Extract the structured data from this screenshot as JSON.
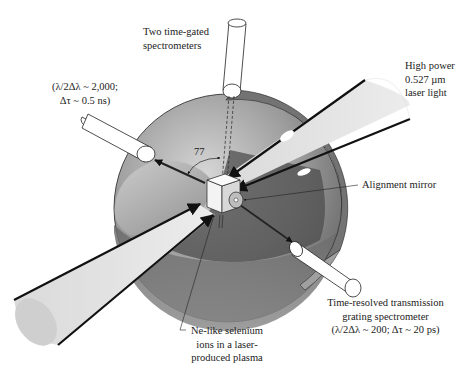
{
  "diagram": {
    "labels": {
      "spectrometers_top": [
        "Two time-gated",
        "spectrometers"
      ],
      "resolution_left": [
        "(λ/2Δλ ~ 2,000;",
        "Δτ ~ 0.5 ns)"
      ],
      "laser": [
        "High power",
        "0.527 µm",
        "laser light"
      ],
      "alignment_mirror": "Alignment mirror",
      "angle": "77",
      "transmission_spectrometer": [
        "Time-resolved transmission",
        "grating spectrometer",
        "(λ/2Δλ ~ 200; Δτ ~ 20 ps)"
      ],
      "plasma": [
        "Ne-like selenium",
        "ions in a laser-",
        "produced plasma"
      ]
    },
    "colors": {
      "sphere_light": "#c8c8c8",
      "sphere_mid": "#9a9a9a",
      "sphere_dark": "#5a5a5a",
      "ring": "#7a7a7a",
      "beam": "#e2e2e2",
      "outline": "#111111"
    }
  }
}
